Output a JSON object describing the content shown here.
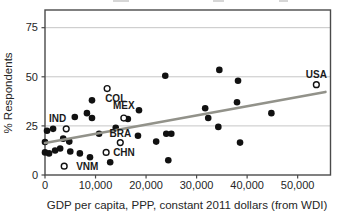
{
  "chart_data": {
    "type": "scatter",
    "title": "",
    "xlabel": "GDP per capita, PPP, constant 2011 dollars (from WDI)",
    "ylabel": "% Respondents",
    "axis_range": {
      "x": [
        0,
        56500
      ],
      "y": [
        0,
        84
      ]
    },
    "grid": "horizontal gridlines at y=25,50,75",
    "x_ticks": [
      {
        "value": 0,
        "label": "0"
      },
      {
        "value": 10000,
        "label": "10,000"
      },
      {
        "value": 20000,
        "label": "20,000"
      },
      {
        "value": 30000,
        "label": "30,000"
      },
      {
        "value": 40000,
        "label": "40,000"
      },
      {
        "value": 50000,
        "label": "50,000"
      }
    ],
    "y_ticks": [
      {
        "value": 0,
        "label": "0"
      },
      {
        "value": 25,
        "label": "25"
      },
      {
        "value": 50,
        "label": "50"
      },
      {
        "value": 75,
        "label": "75"
      }
    ],
    "series": [
      {
        "name": "unlabeled-countries",
        "marker": "filled-circle",
        "points": [
          [
            400,
            22.5
          ],
          [
            1600,
            23.5
          ],
          [
            0,
            16.8
          ],
          [
            0,
            11.5
          ],
          [
            800,
            11
          ],
          [
            2000,
            12.5
          ],
          [
            3000,
            13.5
          ],
          [
            3600,
            18.5
          ],
          [
            4800,
            17
          ],
          [
            5000,
            12
          ],
          [
            6900,
            11
          ],
          [
            8900,
            9
          ],
          [
            5900,
            29.5
          ],
          [
            8300,
            31.5
          ],
          [
            9300,
            38
          ],
          [
            9300,
            29
          ],
          [
            10700,
            21
          ],
          [
            14000,
            24
          ],
          [
            12900,
            6.5
          ],
          [
            16400,
            28.5
          ],
          [
            18600,
            33
          ],
          [
            18400,
            20
          ],
          [
            22000,
            17
          ],
          [
            24000,
            21
          ],
          [
            25000,
            21
          ],
          [
            23800,
            50.5
          ],
          [
            24400,
            7.5
          ],
          [
            31700,
            34
          ],
          [
            32300,
            29
          ],
          [
            34500,
            53.5
          ],
          [
            34300,
            24.5
          ],
          [
            38000,
            37
          ],
          [
            38200,
            48
          ],
          [
            38600,
            16.5
          ],
          [
            44800,
            31.5
          ]
        ]
      },
      {
        "name": "labeled-countries",
        "marker": "open-circle",
        "points": [
          {
            "label": "IND",
            "x": 4200,
            "y": 23.5,
            "anchor": "end",
            "dx": 0,
            "dy": -7
          },
          {
            "label": "VNM",
            "x": 3800,
            "y": 4.5,
            "anchor": "start",
            "dx": 12,
            "dy": 4
          },
          {
            "label": "CHN",
            "x": 12100,
            "y": 11.5,
            "anchor": "start",
            "dx": 7,
            "dy": 4
          },
          {
            "label": "BRA",
            "x": 14900,
            "y": 16.5,
            "anchor": "middle",
            "dx": 0,
            "dy": -6
          },
          {
            "label": "COL",
            "x": 12300,
            "y": 44,
            "anchor": "start",
            "dx": -2,
            "dy": 13
          },
          {
            "label": "MEX",
            "x": 15600,
            "y": 29,
            "anchor": "middle",
            "dx": 0,
            "dy": -9
          },
          {
            "label": "USA",
            "x": 53700,
            "y": 46,
            "anchor": "middle",
            "dx": 0,
            "dy": -7
          }
        ]
      }
    ],
    "trend_line": {
      "x": [
        0,
        55500
      ],
      "y": [
        16.3,
        42.3
      ]
    },
    "colors": {
      "point": "#111111",
      "trend": "#92928a",
      "grid": "#c6c6c6",
      "axis": "#4a4a4a",
      "text": "#262626",
      "background": "#ffffff"
    },
    "legend": "none"
  }
}
